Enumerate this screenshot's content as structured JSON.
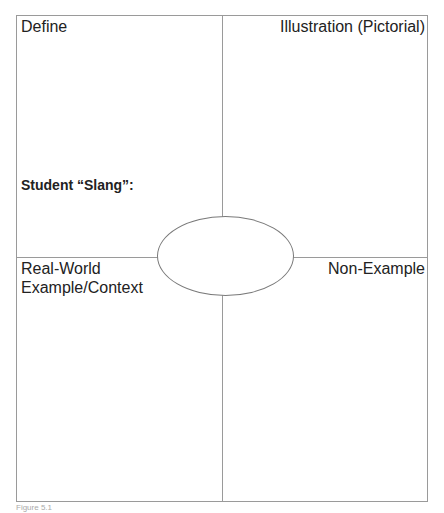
{
  "organizer": {
    "quadrants": {
      "top_left": "Define",
      "top_right": "Illustration (Pictorial)",
      "bottom_left_line1": "Real-World",
      "bottom_left_line2": "Example/Context",
      "bottom_right": "Non-Example"
    },
    "slang_label": "Student “Slang”:",
    "center_term": ""
  },
  "caption": "Figure 5.1"
}
